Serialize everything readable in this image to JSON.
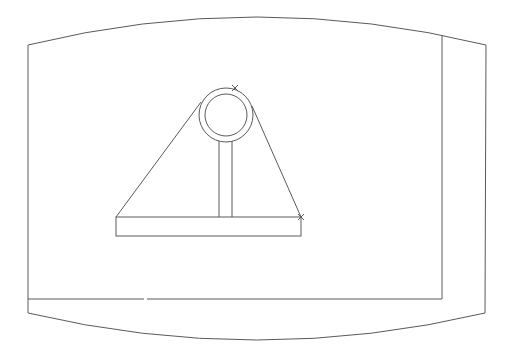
{
  "drawing": {
    "background": "#ffffff",
    "stroke_color": "#5a5a5a",
    "stroke_width": 1,
    "frame": {
      "outer": {
        "top_left": [
          28,
          45
        ],
        "top_right": [
          486,
          45
        ],
        "bottom_left": [
          28,
          313
        ],
        "bottom_right": [
          485,
          313
        ],
        "top_curve_peak_y": 17,
        "bottom_curve_trough_y": 340
      },
      "inner_right_x": 442,
      "inner_bottom_y": 299,
      "inner_bottom_gap": [
        144,
        147
      ]
    },
    "pulley": {
      "center": [
        226,
        115
      ],
      "outer_radius": 27,
      "inner_radius": 21,
      "marker_x": [
        235,
        88
      ]
    },
    "stem": {
      "left_x": 219,
      "right_x": 232,
      "top_y": 141,
      "bottom_y": 217
    },
    "base": {
      "left": 116,
      "right": 301,
      "top": 217,
      "bottom": 236
    },
    "tangent_lines": [
      {
        "from": [
          116,
          217
        ],
        "to": [
          201,
          102
        ]
      },
      {
        "from": [
          252,
          106
        ],
        "to": [
          301,
          217
        ]
      }
    ],
    "markers": [
      {
        "shape": "x",
        "at": [
          235,
          88
        ]
      },
      {
        "shape": "x",
        "at": [
          301,
          217
        ]
      }
    ]
  }
}
